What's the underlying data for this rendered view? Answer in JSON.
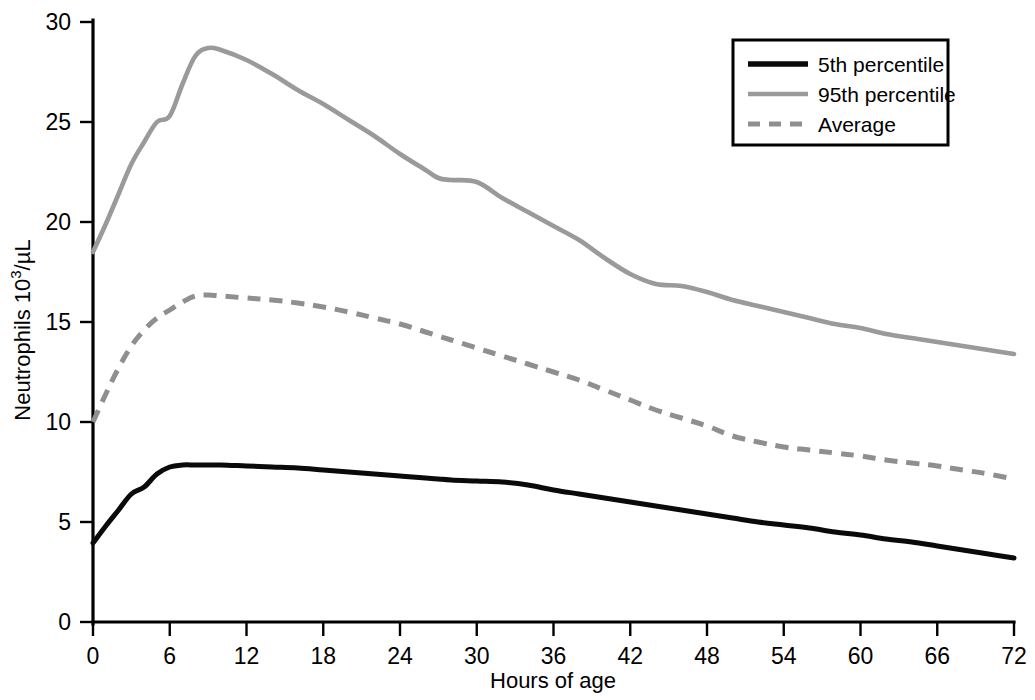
{
  "chart_data": {
    "type": "line",
    "title": "",
    "xlabel": "Hours of age",
    "ylabel": "Neutrophils 10³/µL",
    "ylabel_base": "Neutrophils 10",
    "ylabel_exponent": "3",
    "ylabel_unit": "/µL",
    "xlim": [
      0,
      72
    ],
    "ylim": [
      0,
      30
    ],
    "grid": false,
    "legend_position": "top-right",
    "xticks": [
      0,
      6,
      12,
      18,
      24,
      30,
      36,
      42,
      48,
      54,
      60,
      66,
      72
    ],
    "xtick_labels": [
      "0",
      "6",
      "12",
      "18",
      "24",
      "30",
      "36",
      "42",
      "48",
      "54",
      "60",
      "66",
      "72"
    ],
    "yticks": [
      0,
      5,
      10,
      15,
      20,
      25,
      30
    ],
    "ytick_labels": [
      "0",
      "5",
      "10",
      "15",
      "20",
      "25",
      "30"
    ],
    "x": [
      0,
      1,
      2,
      3,
      4,
      5,
      6,
      7,
      8,
      9,
      10,
      12,
      14,
      16,
      18,
      20,
      22,
      24,
      26,
      27,
      28,
      30,
      32,
      34,
      36,
      38,
      40,
      42,
      44,
      46,
      48,
      50,
      52,
      54,
      56,
      58,
      60,
      62,
      64,
      66,
      68,
      70,
      72
    ],
    "series": [
      {
        "name": "5th percentile",
        "color": "#0a0a0a",
        "style": "solid",
        "values": [
          3.95,
          4.8,
          5.6,
          6.4,
          6.75,
          7.4,
          7.75,
          7.85,
          7.85,
          7.85,
          7.85,
          7.8,
          7.75,
          7.7,
          7.6,
          7.5,
          7.4,
          7.3,
          7.2,
          7.15,
          7.1,
          7.05,
          7.0,
          6.85,
          6.6,
          6.4,
          6.2,
          6.0,
          5.8,
          5.6,
          5.4,
          5.2,
          5.0,
          4.85,
          4.7,
          4.5,
          4.35,
          4.15,
          4.0,
          3.8,
          3.6,
          3.4,
          3.2
        ]
      },
      {
        "name": "95th percentile",
        "color": "#9a9a9a",
        "style": "solid",
        "values": [
          18.5,
          19.9,
          21.4,
          22.9,
          24.0,
          25.0,
          25.3,
          26.9,
          28.3,
          28.7,
          28.6,
          28.1,
          27.4,
          26.6,
          25.9,
          25.1,
          24.3,
          23.4,
          22.6,
          22.2,
          22.1,
          22.0,
          21.2,
          20.5,
          19.8,
          19.1,
          18.2,
          17.4,
          16.9,
          16.8,
          16.5,
          16.1,
          15.8,
          15.5,
          15.2,
          14.9,
          14.7,
          14.4,
          14.2,
          14.0,
          13.8,
          13.6,
          13.4
        ]
      },
      {
        "name": "Average",
        "color": "#8f8f8f",
        "style": "dashed",
        "values": [
          10.0,
          11.4,
          12.7,
          13.8,
          14.6,
          15.2,
          15.6,
          16.0,
          16.3,
          16.35,
          16.3,
          16.2,
          16.1,
          15.95,
          15.75,
          15.5,
          15.2,
          14.9,
          14.5,
          14.3,
          14.1,
          13.7,
          13.3,
          12.9,
          12.5,
          12.1,
          11.6,
          11.1,
          10.6,
          10.2,
          9.8,
          9.3,
          9.0,
          8.75,
          8.6,
          8.45,
          8.3,
          8.1,
          7.95,
          7.8,
          7.6,
          7.4,
          7.15
        ]
      }
    ],
    "legend": [
      {
        "label": "5th percentile",
        "color": "#0a0a0a",
        "style": "solid"
      },
      {
        "label": "95th percentile",
        "color": "#9a9a9a",
        "style": "solid"
      },
      {
        "label": "Average",
        "color": "#8f8f8f",
        "style": "dashed"
      }
    ]
  }
}
